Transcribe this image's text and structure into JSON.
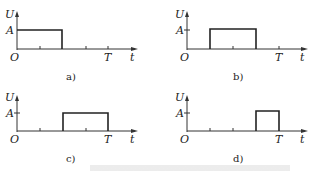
{
  "figure": {
    "axis_labels": {
      "y": "U",
      "x": "t",
      "origin": "O",
      "amplitude": "A",
      "period": "T"
    },
    "panels": [
      {
        "id": "a",
        "caption": "a)",
        "pulse_start_fraction": 0.0,
        "pulse_end_fraction": 0.5
      },
      {
        "id": "b",
        "caption": "b)",
        "pulse_start_fraction": 0.25,
        "pulse_end_fraction": 0.75
      },
      {
        "id": "c",
        "caption": "c)",
        "pulse_start_fraction": 0.5,
        "pulse_end_fraction": 1.0
      },
      {
        "id": "d",
        "caption": "d)",
        "pulse_start_fraction": 0.75,
        "pulse_end_fraction": 1.0
      }
    ],
    "tick_fractions": [
      0.25,
      0.5,
      0.75,
      1.0
    ],
    "bottom_caption": ""
  }
}
